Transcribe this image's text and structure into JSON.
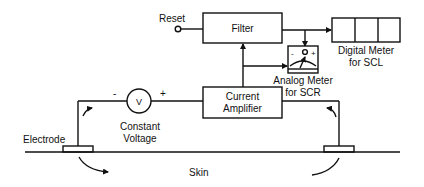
{
  "diagram": {
    "type": "block-diagram",
    "nodes": {
      "reset": {
        "label": "Reset"
      },
      "filter": {
        "label": "Filter"
      },
      "digital_meter": {
        "label_line1": "Digital Meter",
        "label_line2": "for SCL",
        "cells": 3
      },
      "analog_meter": {
        "label_line1": "Analog Meter",
        "label_line2": "for SCR",
        "minus": "-",
        "plus": "+"
      },
      "current_amplifier": {
        "label_line1": "Current",
        "label_line2": "Amplifier"
      },
      "voltage_source": {
        "symbol": "V",
        "minus": "-",
        "plus": "+",
        "label_line1": "Constant",
        "label_line2": "Voltage"
      },
      "electrode": {
        "label": "Electrode"
      },
      "skin": {
        "label": "Skin"
      }
    },
    "edges": [
      {
        "from": "reset",
        "to": "filter"
      },
      {
        "from": "filter",
        "to": "digital_meter"
      },
      {
        "from": "filter",
        "to": "analog_meter"
      },
      {
        "from": "current_amplifier",
        "to": "filter"
      },
      {
        "from": "current_amplifier",
        "to": "analog_meter"
      },
      {
        "from": "voltage_source",
        "to": "current_amplifier"
      },
      {
        "from": "electrode_left",
        "to": "voltage_source"
      },
      {
        "from": "current_amplifier",
        "to": "electrode_right"
      }
    ],
    "colors": {
      "stroke": "#111111",
      "background": "#ffffff"
    }
  }
}
